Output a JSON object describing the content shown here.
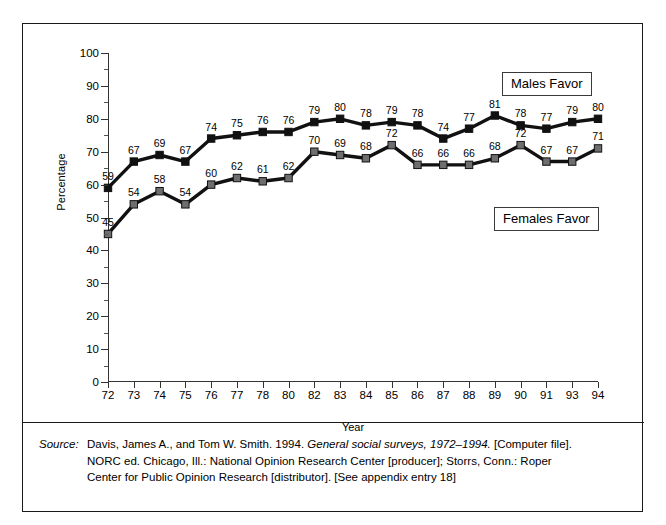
{
  "chart_data": {
    "type": "line",
    "title": "",
    "xlabel": "Year",
    "ylabel": "Percentage",
    "ylim": [
      0,
      100
    ],
    "ytick_step": 10,
    "yminor_step": 5,
    "grid": false,
    "legend_position": "inside-right",
    "categories": [
      "72",
      "73",
      "74",
      "75",
      "76",
      "77",
      "78",
      "80",
      "82",
      "83",
      "84",
      "85",
      "86",
      "87",
      "88",
      "89",
      "90",
      "91",
      "93",
      "94"
    ],
    "series": [
      {
        "name": "Males Favor",
        "marker": "square",
        "color": "#111111",
        "values": [
          59,
          67,
          69,
          67,
          74,
          75,
          76,
          76,
          79,
          80,
          78,
          79,
          78,
          74,
          77,
          81,
          78,
          77,
          79,
          80
        ]
      },
      {
        "name": "Females Favor",
        "marker": "square",
        "color": "#6e6e6e",
        "values": [
          45,
          54,
          58,
          54,
          60,
          62,
          61,
          62,
          70,
          69,
          68,
          72,
          66,
          66,
          66,
          68,
          72,
          67,
          67,
          71
        ]
      }
    ],
    "ytick_labels": [
      "0",
      "10",
      "20",
      "30",
      "40",
      "50",
      "60",
      "70",
      "80",
      "90",
      "100"
    ]
  },
  "legend": {
    "males": "Males Favor",
    "females": "Females Favor"
  },
  "axis": {
    "y_title": "Percentage",
    "x_title": "Year"
  },
  "source": {
    "label": "Source:",
    "line1_a": "Davis, James A., and Tom W. Smith. 1994. ",
    "line1_italic": "General social surveys, 1972–1994.",
    "line1_b": " [Computer file].",
    "line2": "NORC ed. Chicago, Ill.: National Opinion Research Center [producer]; Storrs, Conn.: Roper",
    "line3": "Center for Public Opinion Research [distributor]. [See appendix entry 18]"
  }
}
